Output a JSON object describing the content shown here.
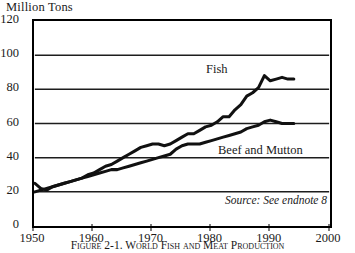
{
  "chart_data": {
    "type": "line",
    "title": "Million Tons",
    "ylabel": "Million Tons",
    "xlabel": "",
    "xlim": [
      1950,
      2000
    ],
    "ylim": [
      0,
      120
    ],
    "yticks": [
      0,
      20,
      40,
      60,
      80,
      100,
      120
    ],
    "xticks": [
      1950,
      1960,
      1970,
      1980,
      1990,
      2000
    ],
    "grid": "horizontal",
    "legend": "inline-labels",
    "annotations": [
      "Source: See endnote 8"
    ],
    "series": [
      {
        "name": "Fish",
        "x": [
          1950,
          1951,
          1952,
          1953,
          1954,
          1955,
          1956,
          1957,
          1958,
          1959,
          1960,
          1961,
          1962,
          1963,
          1964,
          1965,
          1966,
          1967,
          1968,
          1969,
          1970,
          1971,
          1972,
          1973,
          1974,
          1975,
          1976,
          1977,
          1978,
          1979,
          1980,
          1981,
          1982,
          1983,
          1984,
          1985,
          1986,
          1987,
          1988,
          1989,
          1990,
          1991,
          1992,
          1993,
          1994
        ],
        "values": [
          20,
          21,
          22,
          23,
          24,
          25,
          26,
          27,
          28,
          30,
          31,
          33,
          35,
          36,
          38,
          40,
          42,
          44,
          46,
          47,
          48,
          48,
          47,
          48,
          50,
          52,
          54,
          54,
          56,
          58,
          59,
          61,
          64,
          64,
          68,
          71,
          76,
          78,
          81,
          88,
          85,
          86,
          87,
          86,
          86
        ]
      },
      {
        "name": "Beef and Mutton",
        "x": [
          1950,
          1951,
          1952,
          1953,
          1954,
          1955,
          1956,
          1957,
          1958,
          1959,
          1960,
          1961,
          1962,
          1963,
          1964,
          1965,
          1966,
          1967,
          1968,
          1969,
          1970,
          1971,
          1972,
          1973,
          1974,
          1975,
          1976,
          1977,
          1978,
          1979,
          1980,
          1981,
          1982,
          1983,
          1984,
          1985,
          1986,
          1987,
          1988,
          1989,
          1990,
          1991,
          1992,
          1993,
          1994
        ],
        "values": [
          25,
          22,
          21,
          23,
          24,
          25,
          26,
          27,
          28,
          29,
          30,
          31,
          32,
          33,
          33,
          34,
          35,
          36,
          37,
          38,
          39,
          40,
          41,
          42,
          45,
          47,
          48,
          48,
          48,
          49,
          50,
          51,
          52,
          53,
          54,
          55,
          57,
          58,
          59,
          61,
          62,
          61,
          60,
          60,
          60
        ]
      }
    ]
  },
  "axis": {
    "ytick_labels": [
      "0",
      "20",
      "40",
      "60",
      "80",
      "100",
      "120"
    ],
    "xtick_labels": [
      "1950",
      "1960",
      "1970",
      "1980",
      "1990",
      "2000"
    ]
  },
  "labels": {
    "fish": "Fish",
    "beef": "Beef and Mutton",
    "source_note": "Source: See endnote 8",
    "caption": "Figure 2-1. World Fish and Meat Production"
  }
}
